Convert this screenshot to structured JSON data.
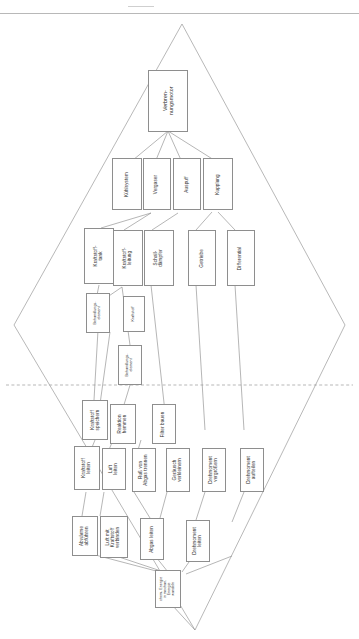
{
  "page": {
    "orientation": "landscape-rotated",
    "rule_color": "#b8b8b8",
    "box_border_color": "#8e8e8e",
    "line_color": "#8e8e8e",
    "axis_style": "dashed"
  },
  "diamond": {
    "top_label": "top-vertex",
    "bottom_label": "bottom-vertex",
    "left_label": "left-vertex",
    "right_label": "right-vertex"
  },
  "nodes": {
    "root": {
      "label": "Verbren-\nnungsmotor"
    },
    "level2": [
      {
        "label": "Kühlsystem"
      },
      {
        "label": "Vergaser"
      },
      {
        "label": "Auspuff"
      },
      {
        "label": "Kupplung"
      }
    ],
    "level3": [
      {
        "label": "Kraftstoff-\ntank"
      },
      {
        "label": "Kraftstoff-\nleitung"
      },
      {
        "label": "Schall-\ndämpfer"
      },
      {
        "label": "Getriebe"
      },
      {
        "label": "Differential"
      }
    ],
    "level4": [
      {
        "label": "Behandlungs-\nelement"
      },
      {
        "label": "Kraftstoff"
      },
      {
        "label": "Behandlungs-\nelement"
      }
    ],
    "functions_a": [
      {
        "label": "Kraftstoff\nspeichern"
      },
      {
        "label": "Reaktion\nhemmen"
      },
      {
        "label": "Filter bauen"
      }
    ],
    "functions_b": [
      {
        "label": "Kraftstoff\nleiten"
      },
      {
        "label": "Luft\nleiten"
      },
      {
        "label": "Ruß von\nAbgas trennen"
      },
      {
        "label": "Geräusch\nverkleinern"
      },
      {
        "label": "Drehmoment\nvergrößern"
      },
      {
        "label": "Drehmoment\naufteilen"
      }
    ],
    "functions_c": [
      {
        "label": "Abwärme\nabführen"
      },
      {
        "label": "Luft mit\nKraftstoff\nverbinden"
      },
      {
        "label": "Abgas leiten"
      },
      {
        "label": "Drehmoment\nleiten"
      }
    ],
    "leaf": {
      "label": "chem. Energie\nin mechan.\nEnergie\nwandeln"
    }
  }
}
